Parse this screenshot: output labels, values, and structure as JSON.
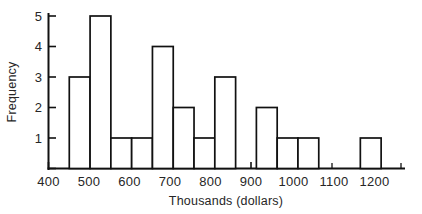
{
  "chart_data": {
    "type": "bar",
    "title": "",
    "subtitle": "",
    "xlabel": "Thousands (dollars)",
    "ylabel": "Frequency",
    "xlim": [
      400,
      1255
    ],
    "ylim": [
      0,
      5.3
    ],
    "bin_width": 50,
    "grid": false,
    "legend": null,
    "xticks": [
      400,
      500,
      600,
      700,
      800,
      900,
      1000,
      1100,
      1200
    ],
    "xtick_labels": [
      "400",
      "500",
      "600",
      "700",
      "800",
      "900",
      "1000",
      "1100",
      "1200"
    ],
    "yticks": [
      1,
      2,
      3,
      4,
      5
    ],
    "ytick_labels": [
      "1",
      "2",
      "3",
      "4",
      "5"
    ],
    "bins": [
      {
        "start": 450,
        "end": 500,
        "value": 3
      },
      {
        "start": 500,
        "end": 550,
        "value": 5
      },
      {
        "start": 550,
        "end": 600,
        "value": 1
      },
      {
        "start": 600,
        "end": 650,
        "value": 1
      },
      {
        "start": 650,
        "end": 700,
        "value": 4
      },
      {
        "start": 700,
        "end": 750,
        "value": 2
      },
      {
        "start": 750,
        "end": 800,
        "value": 1
      },
      {
        "start": 800,
        "end": 850,
        "value": 3
      },
      {
        "start": 850,
        "end": 900,
        "value": 0
      },
      {
        "start": 900,
        "end": 950,
        "value": 2
      },
      {
        "start": 950,
        "end": 1000,
        "value": 1
      },
      {
        "start": 1000,
        "end": 1050,
        "value": 1
      },
      {
        "start": 1050,
        "end": 1100,
        "value": 0
      },
      {
        "start": 1100,
        "end": 1150,
        "value": 0
      },
      {
        "start": 1150,
        "end": 1200,
        "value": 1
      },
      {
        "start": 1200,
        "end": 1250,
        "value": 0
      }
    ],
    "categories": [
      "450-500",
      "500-550",
      "550-600",
      "600-650",
      "650-700",
      "700-750",
      "750-800",
      "800-850",
      "850-900",
      "900-950",
      "950-1000",
      "1000-1050",
      "1050-1100",
      "1100-1150",
      "1150-1200",
      "1200-1250"
    ],
    "values": [
      3,
      5,
      1,
      1,
      4,
      2,
      1,
      3,
      0,
      2,
      1,
      1,
      0,
      0,
      1,
      0
    ],
    "colors": {
      "bar_fill": "#ffffff",
      "bar_stroke": "#111111",
      "axis": "#111111",
      "text": "#262626",
      "background": "#ffffff"
    }
  }
}
